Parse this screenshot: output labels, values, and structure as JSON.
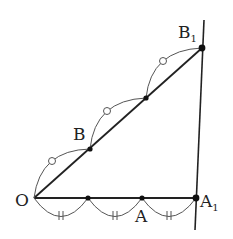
{
  "diagram": {
    "type": "geometry",
    "labels": {
      "O": "O",
      "A": "A",
      "A1_main": "A",
      "A1_sub": "1",
      "B": "B",
      "B1_main": "B",
      "B1_sub": "1"
    },
    "points": {
      "O": [
        34,
        198
      ],
      "P1": [
        88,
        198
      ],
      "A": [
        142,
        198
      ],
      "A1": [
        196,
        198
      ],
      "B": [
        90,
        149
      ],
      "B1": [
        202,
        48
      ]
    },
    "equal_marks": {
      "base_segments": "double tick (||) on each of 3 arcs",
      "ray_segments": "circle (○) on each of 2 arcs"
    },
    "colors": {
      "line": "#222222",
      "arc": "#555555",
      "point": "#111111"
    }
  }
}
